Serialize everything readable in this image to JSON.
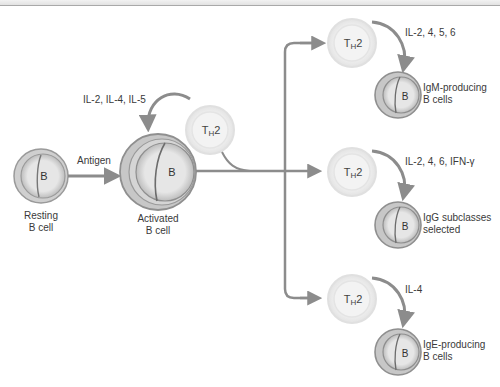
{
  "colors": {
    "arrow": "#8c8c8c",
    "bcell_outer": "#a8a8a8",
    "bcell_fill": "#e4e4e4",
    "th_ring": "#e9e9e9",
    "text": "#3a3a3a"
  },
  "resting_cell": {
    "letter": "B",
    "label_line1": "Resting",
    "label_line2": "B cell"
  },
  "antigen_label": "Antigen",
  "activated_cell": {
    "letter": "B",
    "label_line1": "Activated",
    "label_line2": "B cell"
  },
  "activation_cytokines": "IL-2, IL-4, IL-5",
  "th_cell": {
    "main": "T",
    "sub": "H",
    "suffix": "2"
  },
  "branches": [
    {
      "cytokines": "IL-2, 4, 5, 6",
      "cell_letter": "B",
      "outcome_line1": "IgM-producing",
      "outcome_line2": "B cells"
    },
    {
      "cytokines": "IL-2, 4, 6, IFN-γ",
      "cell_letter": "B",
      "outcome_line1": "IgG subclasses",
      "outcome_line2": "selected"
    },
    {
      "cytokines": "IL-4",
      "cell_letter": "B",
      "outcome_line1": "IgE-producing",
      "outcome_line2": "B cells"
    }
  ]
}
